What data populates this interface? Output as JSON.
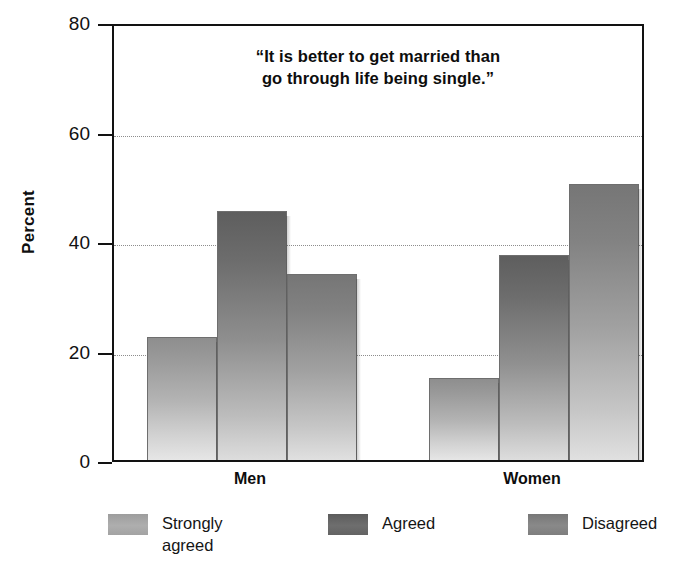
{
  "chart_data": {
    "type": "bar",
    "title": "“It is better to get married than go through life being single.”",
    "title_lines": [
      "“It is better to get married than",
      "go through life being single.”"
    ],
    "xlabel": "",
    "ylabel": "Percent",
    "ylim": [
      0,
      80
    ],
    "ytick_labels": [
      "80",
      "60",
      "40",
      "20",
      "0"
    ],
    "yticks": [
      80,
      60,
      40,
      20,
      0
    ],
    "grid": true,
    "grid_axis": "y",
    "gridlines_at": [
      60,
      40,
      20
    ],
    "legend_position": "bottom",
    "categories": [
      "Men",
      "Women"
    ],
    "series": [
      {
        "name": "Strongly agreed",
        "label_lines": [
          "Strongly",
          "agreed"
        ],
        "color": "#a8a8a8",
        "values": [
          22.5,
          15.0
        ]
      },
      {
        "name": "Agreed",
        "label_lines": [
          "Agreed"
        ],
        "color": "#666666",
        "values": [
          45.5,
          37.5
        ]
      },
      {
        "name": "Disagreed",
        "label_lines": [
          "Disagreed"
        ],
        "color": "#828282",
        "values": [
          34.0,
          50.5
        ]
      }
    ]
  },
  "legend": {
    "items": [
      {
        "label": "Strongly\nagreed"
      },
      {
        "label": "Agreed"
      },
      {
        "label": "Disagreed"
      }
    ]
  },
  "axis": {
    "y_title": "Percent"
  }
}
